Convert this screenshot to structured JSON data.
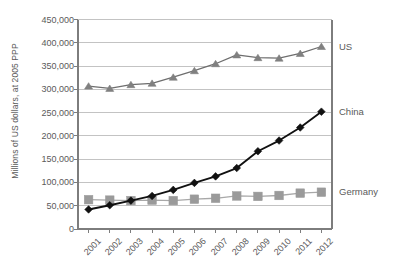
{
  "chart_data": {
    "type": "line",
    "title": "",
    "subtitle": "",
    "xlabel": "",
    "ylabel": "Millions of US dollars, at 2005 PPP",
    "categories": [
      "2001",
      "2002",
      "2003",
      "2004",
      "2005",
      "2006",
      "2007",
      "2008",
      "2009",
      "2010",
      "2011",
      "2012"
    ],
    "x": [
      2001,
      2002,
      2003,
      2004,
      2005,
      2006,
      2007,
      2008,
      2009,
      2010,
      2011,
      2012
    ],
    "ylim": [
      0,
      450000
    ],
    "ytick_values": [
      0,
      50000,
      100000,
      150000,
      200000,
      250000,
      300000,
      350000,
      400000,
      450000
    ],
    "ytick_labels": [
      "0",
      "50,000",
      "100,000",
      "150,000",
      "200,000",
      "250,000",
      "300,000",
      "350,000",
      "400,000",
      "450,000"
    ],
    "grid": true,
    "grid_axis": "y",
    "legend_position": "right-inline-end-of-line",
    "series": [
      {
        "name": "US",
        "marker": "triangle",
        "color": "#808080",
        "line_color": "#6e6e6e",
        "values": [
          307000,
          302000,
          310000,
          313000,
          326000,
          340000,
          355000,
          374000,
          368000,
          367000,
          377000,
          392000
        ]
      },
      {
        "name": "China",
        "marker": "diamond",
        "color": "#111111",
        "line_color": "#111111",
        "values": [
          42000,
          51000,
          61000,
          71000,
          84000,
          99000,
          113000,
          131000,
          167000,
          190000,
          218000,
          252000
        ]
      },
      {
        "name": "Germany",
        "marker": "square",
        "color": "#9a9a9a",
        "line_color": "#a8a8a8",
        "values": [
          63000,
          62000,
          61000,
          62000,
          61000,
          64000,
          66000,
          71000,
          70000,
          72000,
          77000,
          79000
        ]
      }
    ]
  },
  "axis": {
    "ylabel": "Millions of US dollars, at 2005 PPP"
  },
  "colors": {
    "grid": "#c3c3c3",
    "axis": "#7d7d7d",
    "text": "#5a5a5a",
    "us": "#808080",
    "china": "#111111",
    "germany": "#9a9a9a",
    "background": "#ffffff"
  }
}
